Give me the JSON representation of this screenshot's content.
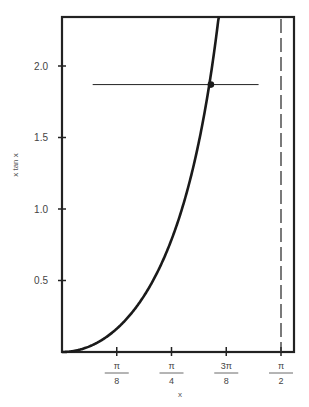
{
  "chart_data": {
    "type": "line",
    "title": "",
    "xlabel": "x",
    "ylabel": "x tan x",
    "xlim": [
      0,
      1.654
    ],
    "ylim": [
      0,
      2.34
    ],
    "grid": false,
    "legend": null,
    "x_ticks": [
      {
        "value": 0.3927,
        "num": "π",
        "den": "8"
      },
      {
        "value": 0.7854,
        "num": "π",
        "den": "4"
      },
      {
        "value": 1.1781,
        "num": "3π",
        "den": "8"
      },
      {
        "value": 1.5708,
        "num": "π",
        "den": "2"
      }
    ],
    "y_ticks": [
      {
        "value": 0.5,
        "label": "0.5"
      },
      {
        "value": 1.0,
        "label": "1.0"
      },
      {
        "value": 1.5,
        "label": "1.5"
      },
      {
        "value": 2.0,
        "label": "2.0"
      }
    ],
    "series": [
      {
        "name": "x tan x",
        "function": "x*tan(x)",
        "x": [
          0,
          0.1,
          0.2,
          0.3,
          0.4,
          0.5,
          0.6,
          0.7,
          0.8,
          0.9,
          1.0,
          1.05,
          1.1,
          1.12
        ],
        "y": [
          0,
          0.01,
          0.041,
          0.093,
          0.169,
          0.273,
          0.41,
          0.59,
          0.824,
          1.134,
          1.557,
          1.826,
          2.165,
          2.32
        ]
      }
    ],
    "annotations": [
      {
        "type": "hline",
        "y": 1.87,
        "x_from": 0.22,
        "x_to": 1.41
      },
      {
        "type": "point",
        "x": 1.068,
        "y": 1.87
      },
      {
        "type": "vline-dashed",
        "x": 1.5708,
        "label": "asymptote x = π/2"
      }
    ]
  }
}
